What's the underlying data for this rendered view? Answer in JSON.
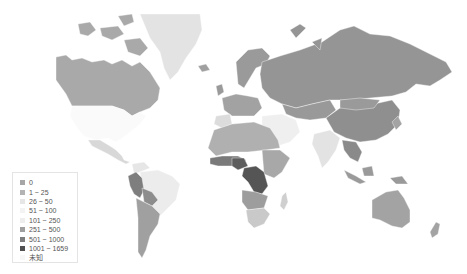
{
  "legend": {
    "items": [
      {
        "label": "0",
        "color": "#a6a6a6"
      },
      {
        "label": "1 ~ 25",
        "color": "#b3b3b3"
      },
      {
        "label": "26 ~ 50",
        "color": "#e6e6e6"
      },
      {
        "label": "51 ~ 100",
        "color": "#f3f3f3"
      },
      {
        "label": "101 ~ 250",
        "color": "#eeeeee"
      },
      {
        "label": "251 ~ 500",
        "color": "#9f9f9f"
      },
      {
        "label": "501 ~ 1000",
        "color": "#7e7e7e"
      },
      {
        "label": "1001 ~ 1659",
        "color": "#505050"
      },
      {
        "label": "未知",
        "color": "#f7f7f7"
      }
    ]
  },
  "regions": [
    {
      "name": "canada",
      "bin": "1 ~ 25",
      "color": "#a9a9a9"
    },
    {
      "name": "greenland",
      "bin": "26 ~ 50",
      "color": "#e3e3e3"
    },
    {
      "name": "usa",
      "bin": "未知",
      "color": "#fafafa"
    },
    {
      "name": "mexico",
      "bin": "26 ~ 50",
      "color": "#d8d8d8"
    },
    {
      "name": "russia",
      "bin": "251 ~ 500",
      "color": "#959595"
    },
    {
      "name": "china",
      "bin": "251 ~ 500",
      "color": "#8f8f8f"
    },
    {
      "name": "europe",
      "bin": "251 ~ 500",
      "color": "#9a9a9a"
    },
    {
      "name": "india",
      "bin": "26 ~ 50",
      "color": "#e3e3e3"
    },
    {
      "name": "australia",
      "bin": "1 ~ 25",
      "color": "#a3a3a3"
    },
    {
      "name": "brazil",
      "bin": "51 ~ 100",
      "color": "#ececec"
    },
    {
      "name": "south-america-west",
      "bin": "501 ~ 1000",
      "color": "#8a8a8a"
    },
    {
      "name": "central-africa",
      "bin": "1001 ~ 1659",
      "color": "#555555"
    },
    {
      "name": "west-africa",
      "bin": "501 ~ 1000",
      "color": "#7a7a7a"
    },
    {
      "name": "north-africa",
      "bin": "1 ~ 25",
      "color": "#b0b0b0"
    },
    {
      "name": "southern-africa",
      "bin": "26 ~ 50",
      "color": "#c9c9c9"
    }
  ]
}
